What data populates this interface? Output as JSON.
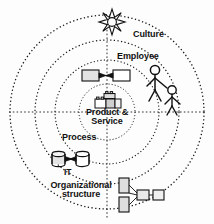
{
  "diagram": {
    "center": {
      "label": "Product & Service",
      "label_line1": "Product &",
      "label_line2": "Service",
      "icon": "building-blocks-icon"
    },
    "rings": [
      {
        "index": 1,
        "name": "core-ring",
        "label": "Product & Service",
        "radius_px": 28
      },
      {
        "index": 2,
        "name": "process-ring",
        "label": "Process",
        "radius_px": 52
      },
      {
        "index": 3,
        "name": "people-ring",
        "label": "Employee",
        "radius_px": 72
      },
      {
        "index": 4,
        "name": "culture-ring",
        "label": "Culture",
        "radius_px": 97
      }
    ],
    "labels": {
      "culture": "Culture",
      "employee": "Employee",
      "process": "Process",
      "it": "IT",
      "org_line1": "Organizational",
      "org_line2": "structure"
    },
    "icons": {
      "sun": "sun-star-icon",
      "process_flow": "process-flow-icon",
      "people": "two-people-icon",
      "database": "database-pair-icon",
      "org_chart": "org-chart-icon",
      "blocks": "building-blocks-icon"
    },
    "colors": {
      "stroke": "#1a1a1a",
      "fill_light": "#e8e8e8",
      "fill_white": "#ffffff",
      "background": "#fdfdfd",
      "text": "#111111"
    },
    "style": {
      "ring_stroke": "dotted",
      "axis_stroke": "dashed"
    }
  }
}
